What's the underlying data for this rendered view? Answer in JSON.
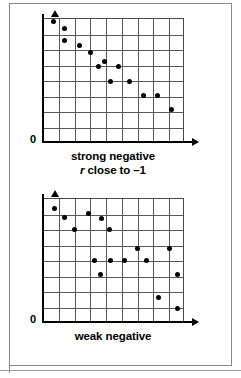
{
  "figure": {
    "background_color": "#ffffff",
    "frame_color": "#8a8a8a",
    "axis_color": "#000000",
    "grid_color": "#5a5a5a",
    "point_color": "#000000"
  },
  "panels": [
    {
      "id": "strong-negative",
      "origin_label": "0",
      "caption_line1": "strong negative",
      "caption_r": "r",
      "caption_line2_rest": " close to –1"
    },
    {
      "id": "weak-negative",
      "origin_label": "0",
      "caption_line1": "weak negative",
      "caption_r": "",
      "caption_line2_rest": ""
    }
  ],
  "chart_data": [
    {
      "type": "scatter",
      "title": "strong negative",
      "subtitle": "r close to –1",
      "xlabel": "",
      "ylabel": "",
      "xlim": [
        0,
        9
      ],
      "ylim": [
        0,
        8
      ],
      "grid": true,
      "ticks": false,
      "legend": false,
      "origin_label": "0",
      "series": [
        {
          "name": "strong negative",
          "points": [
            [
              0.75,
              7.75
            ],
            [
              1.45,
              7.3
            ],
            [
              1.45,
              6.55
            ],
            [
              2.35,
              6.2
            ],
            [
              3.05,
              5.75
            ],
            [
              3.95,
              5.2
            ],
            [
              3.55,
              4.85
            ],
            [
              4.85,
              4.85
            ],
            [
              4.35,
              3.9
            ],
            [
              5.55,
              3.9
            ],
            [
              6.45,
              3.0
            ],
            [
              7.35,
              3.0
            ],
            [
              8.2,
              2.1
            ]
          ]
        }
      ]
    },
    {
      "type": "scatter",
      "title": "weak negative",
      "subtitle": "",
      "xlabel": "",
      "ylabel": "",
      "xlim": [
        0,
        9
      ],
      "ylim": [
        0,
        8
      ],
      "grid": true,
      "ticks": false,
      "legend": false,
      "origin_label": "0",
      "series": [
        {
          "name": "weak negative",
          "points": [
            [
              0.8,
              7.3
            ],
            [
              1.4,
              6.75
            ],
            [
              2.05,
              5.95
            ],
            [
              2.95,
              7.0
            ],
            [
              3.75,
              6.7
            ],
            [
              4.3,
              5.95
            ],
            [
              3.3,
              4.0
            ],
            [
              4.35,
              4.0
            ],
            [
              5.25,
              4.0
            ],
            [
              6.05,
              4.75
            ],
            [
              6.6,
              4.0
            ],
            [
              3.7,
              3.05
            ],
            [
              8.1,
              4.75
            ],
            [
              8.6,
              3.05
            ],
            [
              7.4,
              1.6
            ],
            [
              8.6,
              0.9
            ]
          ]
        }
      ]
    }
  ]
}
